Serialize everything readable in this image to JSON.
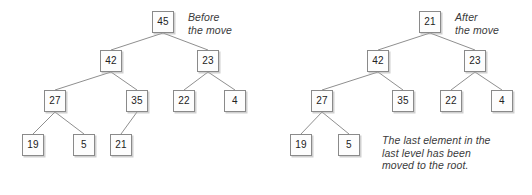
{
  "figure": {
    "style": {
      "node_fill": "#fdfdfd",
      "node_border": "#8a8a8a",
      "edge_color": "#8f8f8f",
      "text_color": "#222222",
      "caption_color": "#3a3a3a",
      "background": "#ffffff"
    }
  },
  "before": {
    "caption_line1": "Before",
    "caption_line2": "the move",
    "nodes": [
      {
        "id": "b-root",
        "label": "45",
        "x": 152,
        "y": 11
      },
      {
        "id": "b-l1",
        "label": "42",
        "x": 100,
        "y": 50
      },
      {
        "id": "b-r1",
        "label": "23",
        "x": 197,
        "y": 50
      },
      {
        "id": "b-l2a",
        "label": "27",
        "x": 44,
        "y": 90
      },
      {
        "id": "b-l2b",
        "label": "35",
        "x": 126,
        "y": 90
      },
      {
        "id": "b-r2a",
        "label": "22",
        "x": 173,
        "y": 90
      },
      {
        "id": "b-r2b",
        "label": "4",
        "x": 224,
        "y": 90
      },
      {
        "id": "b-l3a",
        "label": "19",
        "x": 22,
        "y": 134
      },
      {
        "id": "b-l3b",
        "label": "5",
        "x": 73,
        "y": 134
      },
      {
        "id": "b-l3c",
        "label": "21",
        "x": 110,
        "y": 134
      }
    ],
    "edges": [
      {
        "from": "b-root",
        "to": "b-l1"
      },
      {
        "from": "b-root",
        "to": "b-r1"
      },
      {
        "from": "b-l1",
        "to": "b-l2a"
      },
      {
        "from": "b-l1",
        "to": "b-l2b"
      },
      {
        "from": "b-r1",
        "to": "b-r2a"
      },
      {
        "from": "b-r1",
        "to": "b-r2b"
      },
      {
        "from": "b-l2a",
        "to": "b-l3a"
      },
      {
        "from": "b-l2a",
        "to": "b-l3b"
      },
      {
        "from": "b-l2b",
        "to": "b-l3c"
      }
    ]
  },
  "after": {
    "caption_line1": "After",
    "caption_line2": "the move",
    "note_line1": "The last element in the",
    "note_line2": "last level has been",
    "note_line3": "moved to the root.",
    "nodes": [
      {
        "id": "a-root",
        "label": "21",
        "x": 419,
        "y": 11
      },
      {
        "id": "a-l1",
        "label": "42",
        "x": 367,
        "y": 50
      },
      {
        "id": "a-r1",
        "label": "23",
        "x": 464,
        "y": 50
      },
      {
        "id": "a-l2a",
        "label": "27",
        "x": 311,
        "y": 90
      },
      {
        "id": "a-l2b",
        "label": "35",
        "x": 392,
        "y": 90
      },
      {
        "id": "a-r2a",
        "label": "22",
        "x": 440,
        "y": 90
      },
      {
        "id": "a-r2b",
        "label": "4",
        "x": 491,
        "y": 90
      },
      {
        "id": "a-l3a",
        "label": "19",
        "x": 290,
        "y": 134
      },
      {
        "id": "a-l3b",
        "label": "5",
        "x": 338,
        "y": 134
      }
    ],
    "edges": [
      {
        "from": "a-root",
        "to": "a-l1"
      },
      {
        "from": "a-root",
        "to": "a-r1"
      },
      {
        "from": "a-l1",
        "to": "a-l2a"
      },
      {
        "from": "a-l1",
        "to": "a-l2b"
      },
      {
        "from": "a-r1",
        "to": "a-r2a"
      },
      {
        "from": "a-r1",
        "to": "a-r2b"
      },
      {
        "from": "a-l2a",
        "to": "a-l3a"
      },
      {
        "from": "a-l2a",
        "to": "a-l3b"
      }
    ]
  },
  "captions": {
    "before_pos": {
      "x": 188,
      "y": 11
    },
    "after_pos": {
      "x": 455,
      "y": 11
    },
    "note_pos": {
      "x": 382,
      "y": 134
    }
  }
}
